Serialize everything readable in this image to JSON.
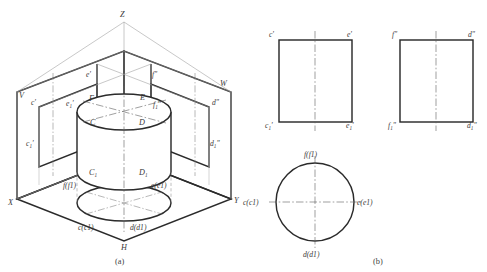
{
  "figure": {
    "captions": {
      "left": "(a)",
      "right": "(b)"
    },
    "axes": {
      "z": "Z",
      "x": "X",
      "y": "Y",
      "h": "H",
      "v": "V",
      "w": "W"
    }
  },
  "pictorial": {
    "name": "isometric-projection-planes-with-cylinder",
    "plane_labels": {
      "v_plane": "V",
      "w_plane": "W",
      "h_plane": "H"
    },
    "axis_labels": {
      "z": "Z",
      "x": "X",
      "y": "Y"
    },
    "v_trace_labels": {
      "top_left": "c'",
      "top_right": "e'",
      "bottom_left": "c'1",
      "bottom_right": "e'1"
    },
    "w_trace_labels": {
      "top_left": "f\"",
      "top_right": "d\"",
      "bottom_left": "f\"1",
      "bottom_right": "d\"1"
    },
    "cylinder_top_points": {
      "front_left": "F",
      "front_right": "E",
      "lower_left": "C",
      "lower_right": "D"
    },
    "cylinder_bottom_points": {
      "left": "C1",
      "right": "D1"
    },
    "h_trace_labels": {
      "top_left": "f(f1)",
      "top_right": "e(e1)",
      "bottom_left": "c(c1)",
      "bottom_right": "d(d1)"
    }
  },
  "orthographic": {
    "front_view": {
      "name": "front-view-square",
      "labels": {
        "top_left": "c'",
        "top_right": "e'",
        "bottom_left": "c'1",
        "bottom_right": "e'1"
      }
    },
    "side_view": {
      "name": "side-view-square",
      "labels": {
        "top_left": "f\"",
        "top_right": "d\"",
        "bottom_left": "f\"1",
        "bottom_right": "d\"1"
      }
    },
    "top_view": {
      "name": "top-view-circle",
      "labels": {
        "top": "f(f1)",
        "left": "c(c1)",
        "right": "e(e1)",
        "bottom": "d(d1)"
      }
    }
  },
  "colors": {
    "background": "#ffffff",
    "outline_dark": "#2b2b2b",
    "outline_mid": "#3d3d3d",
    "construction": "#9a9a9a",
    "centerline": "#7d7d7d",
    "text": "#3a3a3a"
  }
}
